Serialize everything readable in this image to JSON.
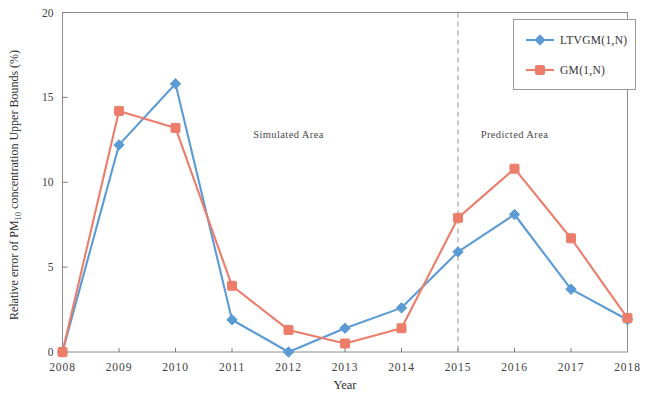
{
  "chart_data": {
    "type": "line",
    "title": "",
    "xlabel": "Year",
    "ylabel": "Relative error of PM10 concentration Upper Bounds (%)",
    "ylabel_parts": {
      "before": "Relative error of PM",
      "subscript": "10",
      "after": " concentration Upper Bounds (%)"
    },
    "x": [
      2008,
      2009,
      2010,
      2011,
      2012,
      2013,
      2014,
      2015,
      2016,
      2017,
      2018
    ],
    "categories": [
      "2008",
      "2009",
      "2010",
      "2011",
      "2012",
      "2013",
      "2014",
      "2015",
      "2016",
      "2017",
      "2018"
    ],
    "xlim": [
      2008,
      2018
    ],
    "ylim": [
      0,
      20
    ],
    "yticks": [
      0,
      5,
      10,
      15,
      20
    ],
    "ytick_labels": [
      "0",
      "5",
      "10",
      "15",
      "20"
    ],
    "grid": false,
    "legend_position": "top-right",
    "series": [
      {
        "name": "LTVGM(1,N)",
        "color": "#5B9BD5",
        "marker": "diamond",
        "values": [
          0.0,
          12.2,
          15.8,
          1.9,
          0.0,
          1.4,
          2.6,
          5.9,
          8.1,
          3.7,
          1.9
        ]
      },
      {
        "name": "GM(1,N)",
        "color": "#ED7D6B",
        "marker": "square",
        "values": [
          0.0,
          14.2,
          13.2,
          3.9,
          1.3,
          0.5,
          1.4,
          7.9,
          10.8,
          6.7,
          2.0
        ]
      }
    ],
    "annotations": [
      {
        "text": "Simulated  Area",
        "x": 2012.0,
        "y": 12.6
      },
      {
        "text": "Predicted  Area",
        "x": 2016.0,
        "y": 12.6
      }
    ],
    "divider": {
      "x": 2015,
      "style": "dashed",
      "color": "#9a9a9a"
    }
  },
  "legend": {
    "entries": [
      {
        "label": "LTVGM(1,N)",
        "color": "#5B9BD5",
        "marker": "diamond"
      },
      {
        "label": "GM(1,N)",
        "color": "#ED7D6B",
        "marker": "square"
      }
    ]
  }
}
